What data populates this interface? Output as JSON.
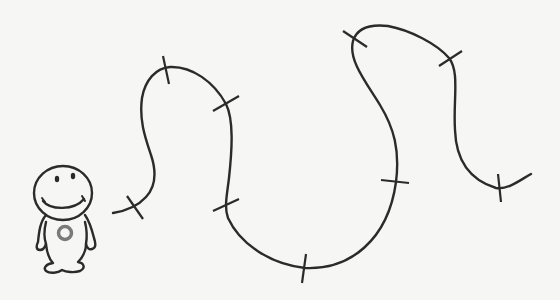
{
  "scene": {
    "description": "Line drawing of a smiling cartoon character standing next to a long wavy path with cross-tick marks",
    "background_color": "#f6f6f5",
    "line_color": "#2b2b2b"
  },
  "character": {
    "name": "smiling-figure",
    "face": "smile",
    "chest_ring_color": "#7a7a7a"
  },
  "path": {
    "tick_count": 9,
    "start": [
      113,
      213
    ],
    "end": [
      531,
      174
    ],
    "ticks": [
      {
        "index": 1,
        "at": [
          134,
          206
        ]
      },
      {
        "index": 2,
        "at": [
          166,
          67
        ]
      },
      {
        "index": 3,
        "at": [
          226,
          104
        ]
      },
      {
        "index": 4,
        "at": [
          225,
          206
        ]
      },
      {
        "index": 5,
        "at": [
          304,
          268
        ]
      },
      {
        "index": 6,
        "at": [
          396,
          182
        ]
      },
      {
        "index": 7,
        "at": [
          354,
          39
        ]
      },
      {
        "index": 8,
        "at": [
          450,
          58
        ]
      },
      {
        "index": 9,
        "at": [
          499,
          188
        ]
      }
    ]
  }
}
